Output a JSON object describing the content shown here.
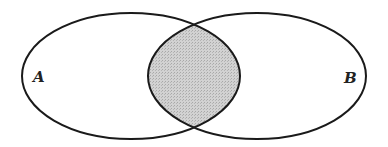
{
  "diagram": {
    "type": "venn",
    "sets": [
      {
        "label": "A",
        "cx": 131,
        "cy": 76,
        "rx": 109,
        "ry": 63
      },
      {
        "label": "B",
        "cx": 257,
        "cy": 76,
        "rx": 109,
        "ry": 63
      }
    ],
    "shaded_region": "A ∩ B",
    "colors": {
      "stroke": "#1a1a1a",
      "shade": "#c8c8c8",
      "background": "#ffffff"
    }
  }
}
